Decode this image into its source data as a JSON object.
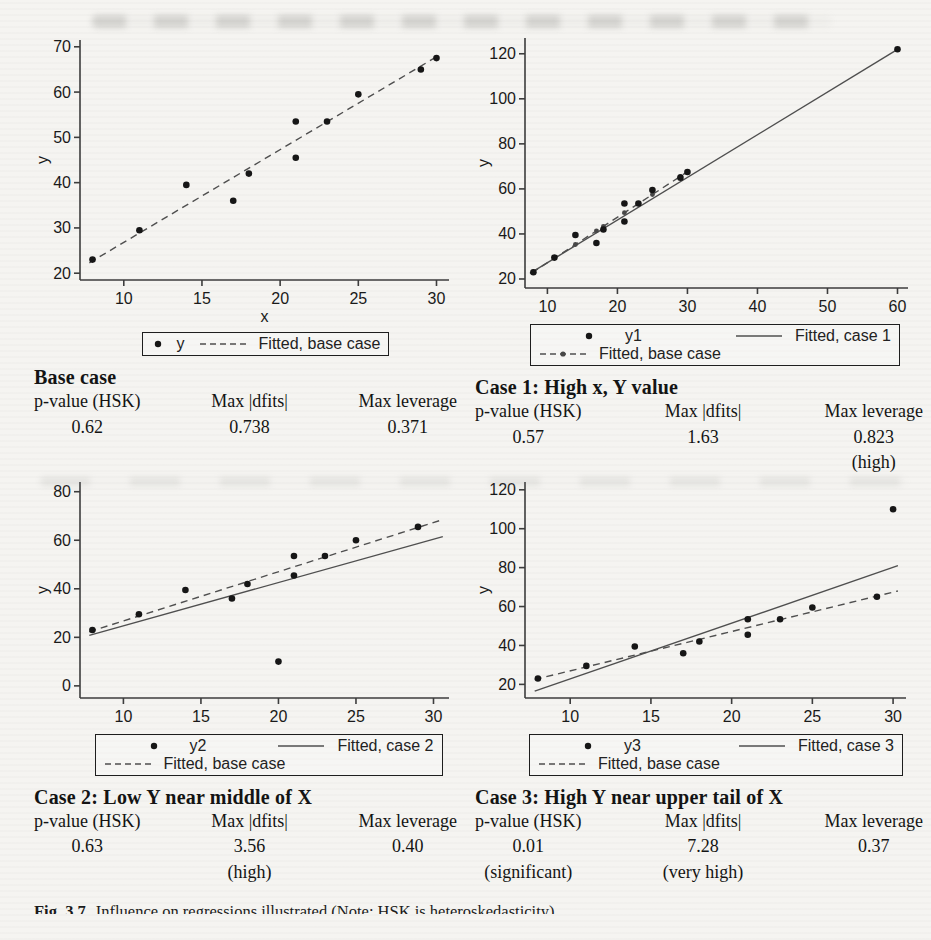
{
  "caption": {
    "label": "Fig. 3.7",
    "text": "Influence on regressions illustrated (Note: HSK is heteroskedasticity)"
  },
  "panels": [
    {
      "heading": "Base case",
      "stats": {
        "p_label": "p-value (HSK)",
        "p_value": "0.62",
        "p_qual": "",
        "dfits_label": "Max |dfits|",
        "dfits_value": "0.738",
        "dfits_qual": "",
        "lev_label": "Max leverage",
        "lev_value": "0.371",
        "lev_qual": ""
      }
    },
    {
      "heading": "Case 1: High x, Y value",
      "stats": {
        "p_label": "p-value (HSK)",
        "p_value": "0.57",
        "p_qual": "",
        "dfits_label": "Max |dfits|",
        "dfits_value": "1.63",
        "dfits_qual": "",
        "lev_label": "Max leverage",
        "lev_value": "0.823",
        "lev_qual": "(high)"
      }
    },
    {
      "heading": "Case 2: Low Y near middle of X",
      "stats": {
        "p_label": "p-value (HSK)",
        "p_value": "0.63",
        "p_qual": "",
        "dfits_label": "Max |dfits|",
        "dfits_value": "3.56",
        "dfits_qual": "(high)",
        "lev_label": "Max leverage",
        "lev_value": "0.40",
        "lev_qual": ""
      }
    },
    {
      "heading": "Case 3:  High Y near upper tail of X",
      "stats": {
        "p_label": "p-value (HSK)",
        "p_value": "0.01",
        "p_qual": "(significant)",
        "dfits_label": "Max |dfits|",
        "dfits_value": "7.28",
        "dfits_qual": "(very high)",
        "lev_label": "Max leverage",
        "lev_value": "0.37",
        "lev_qual": ""
      }
    }
  ],
  "chart_data": [
    {
      "type": "scatter",
      "title": "Base case",
      "xlabel": "x",
      "ylabel": "y",
      "x_range": [
        7.2,
        30.8
      ],
      "y_range": [
        18.5,
        71.5
      ],
      "x_ticks": [
        10,
        15,
        20,
        25,
        30
      ],
      "y_ticks": [
        20,
        30,
        40,
        50,
        60,
        70
      ],
      "points": [
        [
          8,
          23
        ],
        [
          11,
          29.5
        ],
        [
          14,
          39.5
        ],
        [
          17,
          36
        ],
        [
          18,
          42
        ],
        [
          21,
          45.5
        ],
        [
          21,
          53.5
        ],
        [
          23,
          53.5
        ],
        [
          25,
          59.5
        ],
        [
          29,
          65
        ],
        [
          30,
          67.5
        ]
      ],
      "lines": [
        {
          "label": "Fitted, base case",
          "style": "dashed",
          "from": [
            7.8,
            22.3
          ],
          "to": [
            30.2,
            68.2
          ]
        }
      ],
      "legend": [
        [
          {
            "sym": "dot",
            "label": "y"
          },
          {
            "sym": "dashed",
            "label": "Fitted, base case"
          }
        ]
      ]
    },
    {
      "type": "scatter",
      "title": "Case 1: High x, Y value",
      "xlabel": "",
      "ylabel": "y",
      "x_range": [
        6.8,
        61.5
      ],
      "y_range": [
        16,
        127
      ],
      "x_ticks": [
        10,
        20,
        30,
        40,
        50,
        60
      ],
      "y_ticks": [
        20,
        40,
        60,
        80,
        100,
        120
      ],
      "points": [
        [
          8,
          23
        ],
        [
          11,
          29.5
        ],
        [
          14,
          39.5
        ],
        [
          17,
          36
        ],
        [
          18,
          42
        ],
        [
          21,
          45.5
        ],
        [
          21,
          53.5
        ],
        [
          23,
          53.5
        ],
        [
          25,
          59.5
        ],
        [
          29,
          65
        ],
        [
          30,
          67.5
        ],
        [
          60,
          122
        ]
      ],
      "lines": [
        {
          "label": "Fitted, case 1",
          "style": "solid",
          "from": [
            7.5,
            22.5
          ],
          "to": [
            60.3,
            122.5
          ]
        },
        {
          "label": "Fitted, base case",
          "style": "dashed",
          "from": [
            7.8,
            22.8
          ],
          "to": [
            30.2,
            68
          ],
          "markers_at": [
            8,
            11,
            14,
            17,
            18,
            21,
            23,
            25,
            29,
            30
          ]
        }
      ],
      "legend": [
        [
          {
            "sym": "dot",
            "label": "y1"
          },
          {
            "sym": "solid",
            "label": "Fitted, case 1"
          }
        ],
        [
          {
            "sym": "dashed-dot",
            "label": "Fitted, base case"
          }
        ]
      ]
    },
    {
      "type": "scatter",
      "title": "Case 2: Low Y near middle of X",
      "xlabel": "",
      "ylabel": "y",
      "x_range": [
        7.2,
        31
      ],
      "y_range": [
        -5,
        84
      ],
      "x_ticks": [
        10,
        15,
        20,
        25,
        30
      ],
      "y_ticks": [
        0,
        20,
        40,
        60,
        80
      ],
      "points": [
        [
          8,
          23
        ],
        [
          11,
          29.5
        ],
        [
          14,
          39.5
        ],
        [
          17,
          36
        ],
        [
          18,
          42
        ],
        [
          20,
          10
        ],
        [
          21,
          45.5
        ],
        [
          21,
          53.5
        ],
        [
          23,
          53.5
        ],
        [
          25,
          60
        ],
        [
          29,
          65.5
        ]
      ],
      "lines": [
        {
          "label": "Fitted, case 2",
          "style": "solid",
          "from": [
            7.8,
            20.8
          ],
          "to": [
            30.6,
            61.5
          ]
        },
        {
          "label": "Fitted, base case",
          "style": "dashed",
          "from": [
            7.8,
            22.3
          ],
          "to": [
            30.6,
            68.5
          ]
        }
      ],
      "legend": [
        [
          {
            "sym": "dot",
            "label": "y2"
          },
          {
            "sym": "solid",
            "label": "Fitted, case 2"
          }
        ],
        [
          {
            "sym": "dashed",
            "label": "Fitted, base case"
          }
        ]
      ]
    },
    {
      "type": "scatter",
      "title": "Case 3: High Y near upper tail of X",
      "xlabel": "",
      "ylabel": "y",
      "x_range": [
        7.2,
        30.8
      ],
      "y_range": [
        13,
        124
      ],
      "x_ticks": [
        10,
        15,
        20,
        25,
        30
      ],
      "y_ticks": [
        20,
        40,
        60,
        80,
        100,
        120
      ],
      "points": [
        [
          8,
          23
        ],
        [
          11,
          29.5
        ],
        [
          14,
          39.5
        ],
        [
          17,
          36
        ],
        [
          18,
          42
        ],
        [
          21,
          45.5
        ],
        [
          21,
          53.5
        ],
        [
          23,
          53.5
        ],
        [
          25,
          59.5
        ],
        [
          29,
          65
        ],
        [
          30,
          110
        ]
      ],
      "lines": [
        {
          "label": "Fitted, case 3",
          "style": "solid",
          "from": [
            7.8,
            16.5
          ],
          "to": [
            30.3,
            81
          ]
        },
        {
          "label": "Fitted, base case",
          "style": "dashed",
          "from": [
            7.8,
            22.5
          ],
          "to": [
            30.3,
            68
          ]
        }
      ],
      "legend": [
        [
          {
            "sym": "dot",
            "label": "y3"
          },
          {
            "sym": "solid",
            "label": "Fitted, case 3"
          }
        ],
        [
          {
            "sym": "dashed",
            "label": "Fitted, base case"
          }
        ]
      ]
    }
  ]
}
